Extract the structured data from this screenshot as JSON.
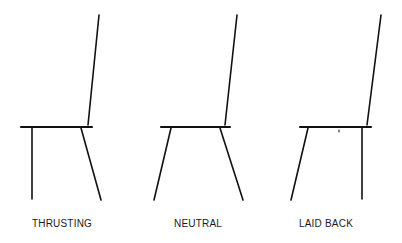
{
  "diagram": {
    "type": "chair-posture-comparison",
    "line_color": "#111111",
    "chairs": [
      {
        "label": "THRUSTING",
        "label_x": 62,
        "seat": [
          21,
          127,
          92,
          127
        ],
        "back": [
          88,
          125,
          99,
          15
        ],
        "front_leg": [
          32,
          128,
          32,
          199
        ],
        "rear_leg": [
          81,
          128,
          101,
          200
        ]
      },
      {
        "label": "NEUTRAL",
        "label_x": 198,
        "seat": [
          161,
          127,
          230,
          127
        ],
        "back": [
          225,
          125,
          237,
          15
        ],
        "front_leg": [
          171,
          128,
          154,
          200
        ],
        "rear_leg": [
          220,
          128,
          243,
          200
        ]
      },
      {
        "label": "LAID BACK",
        "label_x": 326,
        "seat": [
          300,
          127,
          371,
          127
        ],
        "back": [
          367,
          125,
          381,
          15
        ],
        "front_leg": [
          308,
          128,
          291,
          200
        ],
        "rear_leg": [
          362,
          128,
          362,
          199
        ]
      }
    ]
  }
}
